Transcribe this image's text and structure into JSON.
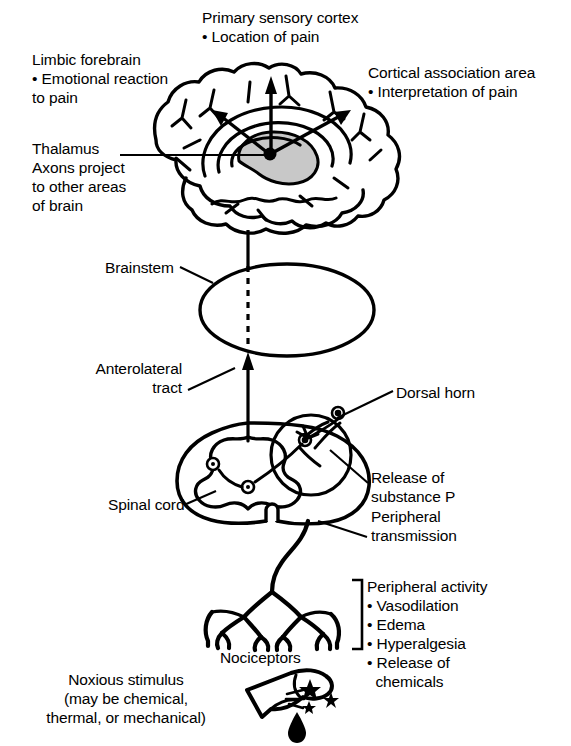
{
  "figure": {
    "width": 571,
    "height": 746,
    "background_color": "#ffffff",
    "line_color": "#000000",
    "thalamus_fill_color": "#c8c8c8"
  },
  "labels": {
    "primary_sensory_cortex": "Primary sensory cortex\n• Location of pain",
    "limbic_forebrain": "Limbic forebrain\n• Emotional reaction\nto pain",
    "cortical_association_area": "Cortical association area\n• Interpretation of pain",
    "thalamus": "Thalamus\nAxons project\nto other areas\nof brain",
    "brainstem": "Brainstem",
    "anterolateral_tract": "Anterolateral\ntract",
    "dorsal_horn": "Dorsal horn",
    "release_of_substance_p": "Release of\nsubstance P",
    "peripheral_transmission": "Peripheral\ntransmission",
    "peripheral_activity": "Peripheral activity\n• Vasodilation\n• Edema\n• Hyperalgesia\n• Release of\n  chemicals",
    "spinal_cord": "Spinal cord",
    "nociceptors": "Nociceptors",
    "noxious_stimulus": "Noxious stimulus\n(may be chemical,\nthermal, or mechanical)"
  },
  "peripheral_activity_items": [
    "Peripheral activity",
    "• Vasodilation",
    "• Edema",
    "• Hyperalgesia",
    "• Release of",
    "  chemicals"
  ],
  "anatomy_parts": [
    "brain",
    "thalamus",
    "brainstem",
    "spinal-cord",
    "dorsal-horn",
    "peripheral-nerve",
    "nociceptors",
    "finger"
  ]
}
